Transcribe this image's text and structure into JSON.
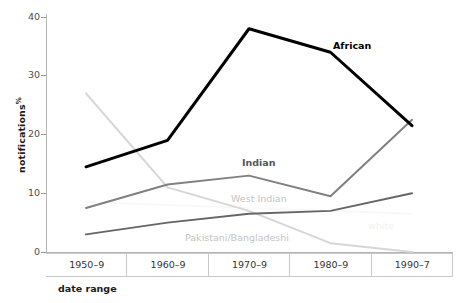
{
  "chart_data": {
    "type": "line",
    "title": "",
    "xlabel": "date range",
    "ylabel": "notifications",
    "ylabel_unit": "%",
    "categories": [
      "1950–9",
      "1960–9",
      "1970–9",
      "1980–9",
      "1990–7"
    ],
    "ylim": [
      0,
      40
    ],
    "yticks": [
      0,
      10,
      20,
      30,
      40
    ],
    "grid": false,
    "legend": "inline-labels",
    "series": [
      {
        "name": "African",
        "color": "#000000",
        "values": [
          14.5,
          19.0,
          38.0,
          34.0,
          21.5
        ]
      },
      {
        "name": "Indian",
        "color": "#808080",
        "values": [
          7.5,
          11.5,
          13.0,
          9.5,
          22.5
        ]
      },
      {
        "name": "West Indian",
        "color": "#d6d6d6",
        "values": [
          27.0,
          11.0,
          7.0,
          1.5,
          0.0
        ]
      },
      {
        "name": "Pakistani/Bangladeshi",
        "color": "#666666",
        "values": [
          3.0,
          5.0,
          6.5,
          7.0,
          10.0
        ]
      },
      {
        "name": "white",
        "color": "#f7f7f7",
        "values": [
          8.5,
          8.0,
          7.5,
          7.0,
          6.5
        ]
      }
    ],
    "annotations": [
      {
        "text": "African",
        "x": 333,
        "y": 40
      },
      {
        "text": "Indian",
        "x": 242,
        "y": 157
      },
      {
        "text": "West Indian",
        "x": 231,
        "y": 193
      },
      {
        "text": "Pakistani/Bangladeshi",
        "x": 185,
        "y": 232
      },
      {
        "text": "white",
        "x": 368,
        "y": 220
      }
    ]
  },
  "axis": {
    "y_ticks": [
      "40",
      "30",
      "20",
      "10",
      "0"
    ],
    "y_title": "notifications",
    "y_unit": "%",
    "x_title": "date range",
    "x_categories": [
      "1950–9",
      "1960–9",
      "1970–9",
      "1980–9",
      "1990–7"
    ]
  }
}
